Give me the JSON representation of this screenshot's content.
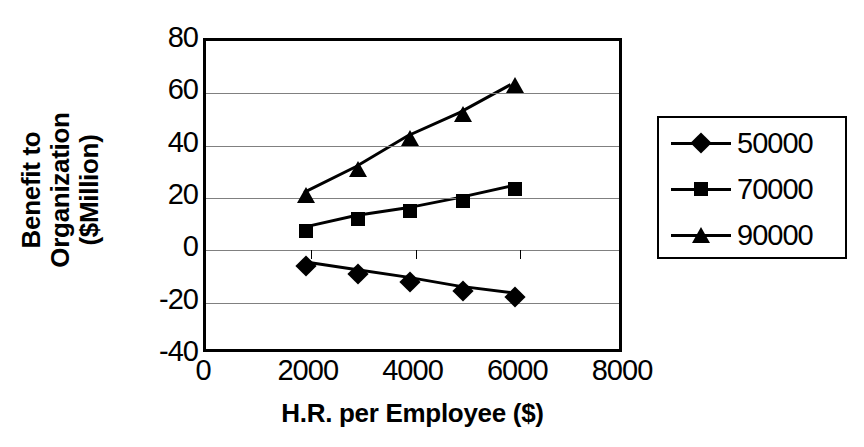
{
  "chart_data": {
    "type": "line",
    "title": "",
    "xlabel": "H.R. per Employee ($)",
    "ylabel_line1": "Benefit to",
    "ylabel_line2": "Organization",
    "ylabel_line3": "($Million)",
    "ylabel": "Benefit to Organization ($Million)",
    "xlim": [
      0,
      8000
    ],
    "ylim": [
      -40,
      80
    ],
    "xticks": [
      0,
      2000,
      4000,
      6000,
      8000
    ],
    "xtick_labels": [
      "0",
      "2000",
      "4000",
      "6000",
      "8000"
    ],
    "yticks": [
      -40,
      -20,
      0,
      20,
      40,
      60,
      80
    ],
    "ytick_labels": [
      "80",
      "60",
      "40",
      "20",
      "0",
      "-20",
      "-40"
    ],
    "grid": true,
    "grid_axis": "y",
    "legend_position": "right-outside",
    "x": [
      1900,
      2900,
      3900,
      4900,
      5900
    ],
    "series": [
      {
        "name": "50000",
        "marker": "diamond",
        "values": [
          -6,
          -9,
          -12,
          -15.5,
          -18
        ]
      },
      {
        "name": "70000",
        "marker": "square",
        "values": [
          7.5,
          12,
          15,
          19,
          23.5
        ]
      },
      {
        "name": "90000",
        "marker": "triangle",
        "values": [
          21,
          31,
          43,
          52,
          63
        ]
      }
    ],
    "colors": {
      "series": "#000000",
      "grid": "#808080",
      "axis": "#000000",
      "background": "#ffffff"
    }
  },
  "legend": {
    "entries": [
      {
        "label": "50000",
        "marker": "diamond-marker-icon"
      },
      {
        "label": "70000",
        "marker": "square-marker-icon"
      },
      {
        "label": "90000",
        "marker": "triangle-marker-icon"
      }
    ]
  }
}
